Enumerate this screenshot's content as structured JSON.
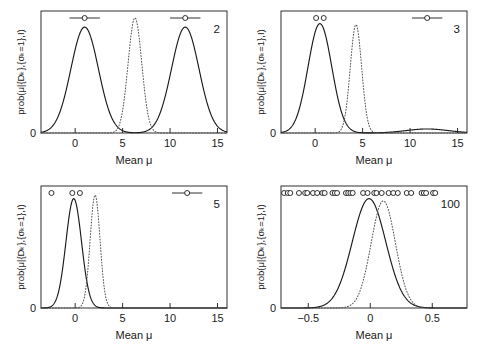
{
  "figure": {
    "background": "#ffffff",
    "ink": "#1a1a1a",
    "solid_color": "#1a1a1a",
    "dotted_color": "#555555",
    "axis_x_title": "Mean",
    "axis_x_symbol": "μ",
    "axis_y_title": "prob(μ|{Dₖ},{σₖ=1},I)",
    "axis_y_zero_label": "0"
  },
  "chart_data": [
    {
      "type": "line",
      "panel_label": "2",
      "title": "",
      "xlabel": "Mean  μ",
      "ylabel": "prob(μ|{Dₖ},{σₖ=1},I)",
      "xlim": [
        -3.6,
        16.0
      ],
      "ylim": [
        0,
        1.06
      ],
      "xticks": [
        0,
        5,
        10,
        15
      ],
      "xticklabels": [
        "0",
        "5",
        "10",
        "15"
      ],
      "yticks": [
        0
      ],
      "yticklabels": [
        "0"
      ],
      "grid": false,
      "legend": "none",
      "series": [
        {
          "name": "posterior-solid",
          "style": "solid",
          "kind": "bimodal",
          "peaks": [
            {
              "center": 1.0,
              "width": 1.45,
              "height": 0.92
            },
            {
              "center": 11.6,
              "width": 1.45,
              "height": 0.92
            }
          ],
          "floor": 0.0
        },
        {
          "name": "gaussian-dotted",
          "style": "dotted",
          "kind": "gaussian",
          "center": 6.3,
          "width": 0.72,
          "height": 1.0
        }
      ],
      "annotations": {
        "name": "data-markers",
        "markers": [
          {
            "x": 1.0,
            "err": 1.6,
            "errorbar": true
          },
          {
            "x": 11.6,
            "err": 1.6,
            "errorbar": true
          }
        ]
      }
    },
    {
      "type": "line",
      "panel_label": "3",
      "title": "",
      "xlabel": "Mean  μ",
      "ylabel": "prob(μ|{Dₖ},{σₖ=1},I)",
      "xlim": [
        -3.6,
        16.0
      ],
      "ylim": [
        0,
        1.06
      ],
      "xticks": [
        0,
        5,
        10,
        15
      ],
      "xticklabels": [
        "0",
        "5",
        "10",
        "15"
      ],
      "yticks": [
        0
      ],
      "yticklabels": [
        "0"
      ],
      "grid": false,
      "legend": "none",
      "series": [
        {
          "name": "posterior-solid",
          "style": "solid",
          "kind": "peak-plus-tail",
          "peaks": [
            {
              "center": 0.5,
              "width": 1.25,
              "height": 0.95
            }
          ],
          "tail": {
            "center": 11.8,
            "width": 2.2,
            "height": 0.035
          }
        },
        {
          "name": "gaussian-dotted",
          "style": "dotted",
          "kind": "gaussian",
          "center": 4.3,
          "width": 0.6,
          "height": 0.94
        }
      ],
      "annotations": {
        "name": "data-markers",
        "markers": [
          {
            "x": 0.1,
            "errorbar": false
          },
          {
            "x": 0.9,
            "errorbar": false
          },
          {
            "x": 11.8,
            "err": 1.6,
            "errorbar": true
          }
        ]
      }
    },
    {
      "type": "line",
      "panel_label": "5",
      "title": "",
      "xlabel": "Mean  μ",
      "ylabel": "prob(μ|{Dₖ},{σₖ=1},I)",
      "xlim": [
        -3.6,
        16.0
      ],
      "ylim": [
        0,
        1.06
      ],
      "xticks": [
        0,
        5,
        10,
        15
      ],
      "xticklabels": [
        "0",
        "5",
        "10",
        "15"
      ],
      "yticks": [
        0
      ],
      "yticklabels": [
        "0"
      ],
      "grid": false,
      "legend": "none",
      "series": [
        {
          "name": "posterior-solid",
          "style": "solid",
          "kind": "gaussian",
          "center": -0.15,
          "width": 0.82,
          "height": 0.95
        },
        {
          "name": "gaussian-dotted",
          "style": "dotted",
          "kind": "gaussian",
          "center": 2.1,
          "width": 0.52,
          "height": 0.98
        }
      ],
      "annotations": {
        "name": "data-markers",
        "markers": [
          {
            "x": -2.5,
            "errorbar": false
          },
          {
            "x": -0.3,
            "errorbar": false
          },
          {
            "x": 0.5,
            "errorbar": false
          },
          {
            "x": 11.8,
            "err": 1.6,
            "errorbar": true
          }
        ]
      }
    },
    {
      "type": "line",
      "panel_label": "100",
      "title": "",
      "xlabel": "Mean  μ",
      "ylabel": "prob(μ|{Dₖ},{σₖ=1},I)",
      "xlim": [
        -0.72,
        0.78
      ],
      "ylim": [
        0,
        1.06
      ],
      "xticks": [
        -0.5,
        0,
        0.5
      ],
      "xticklabels": [
        "−0.5",
        "0",
        "0.5"
      ],
      "yticks": [
        0
      ],
      "yticklabels": [
        "0"
      ],
      "grid": false,
      "legend": "none",
      "series": [
        {
          "name": "posterior-solid",
          "style": "solid",
          "kind": "gaussian",
          "center": -0.01,
          "width": 0.135,
          "height": 0.95
        },
        {
          "name": "gaussian-dotted",
          "style": "dotted",
          "kind": "gaussian",
          "center": 0.105,
          "width": 0.098,
          "height": 0.93
        }
      ],
      "annotations": {
        "name": "data-markers",
        "markers": [
          {
            "x": -0.695,
            "errorbar": false
          },
          {
            "x": -0.665,
            "errorbar": false
          },
          {
            "x": -0.645,
            "errorbar": false
          },
          {
            "x": -0.575,
            "errorbar": false
          },
          {
            "x": -0.525,
            "errorbar": false
          },
          {
            "x": -0.508,
            "errorbar": false
          },
          {
            "x": -0.462,
            "errorbar": false
          },
          {
            "x": -0.428,
            "errorbar": false
          },
          {
            "x": -0.386,
            "errorbar": false
          },
          {
            "x": -0.368,
            "errorbar": false
          },
          {
            "x": -0.305,
            "errorbar": false
          },
          {
            "x": -0.286,
            "errorbar": false
          },
          {
            "x": -0.268,
            "errorbar": false
          },
          {
            "x": -0.196,
            "errorbar": false
          },
          {
            "x": -0.178,
            "errorbar": false
          },
          {
            "x": -0.16,
            "errorbar": false
          },
          {
            "x": -0.142,
            "errorbar": false
          },
          {
            "x": -0.058,
            "errorbar": false
          },
          {
            "x": -0.022,
            "errorbar": false
          },
          {
            "x": 0.032,
            "errorbar": false
          },
          {
            "x": 0.05,
            "errorbar": false
          },
          {
            "x": 0.092,
            "errorbar": false
          },
          {
            "x": 0.148,
            "errorbar": false
          },
          {
            "x": 0.186,
            "errorbar": false
          },
          {
            "x": 0.222,
            "errorbar": false
          },
          {
            "x": 0.294,
            "errorbar": false
          },
          {
            "x": 0.33,
            "errorbar": false
          },
          {
            "x": 0.414,
            "errorbar": false
          },
          {
            "x": 0.432,
            "errorbar": false
          },
          {
            "x": 0.45,
            "errorbar": false
          },
          {
            "x": 0.506,
            "errorbar": false
          },
          {
            "x": 0.524,
            "errorbar": false
          }
        ]
      }
    }
  ]
}
